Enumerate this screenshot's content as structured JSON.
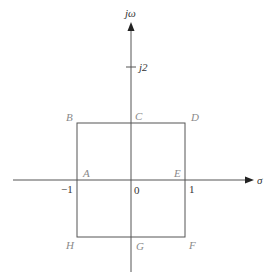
{
  "diagram": {
    "type": "s-plane contour",
    "axes": {
      "horizontal": {
        "label": "σ"
      },
      "vertical": {
        "label": "jω"
      }
    },
    "ticks": {
      "imag": {
        "label": "j2"
      },
      "real_neg": {
        "label": "−1"
      },
      "origin": {
        "label": "0"
      },
      "real_pos": {
        "label": "1"
      }
    },
    "points": {
      "A": "A",
      "B": "B",
      "C": "C",
      "D": "D",
      "E": "E",
      "F": "F",
      "G": "G",
      "H": "H"
    },
    "colors": {
      "lines": "#555555",
      "point_labels": "#8a8a8a",
      "axis_text": "#333333"
    }
  }
}
